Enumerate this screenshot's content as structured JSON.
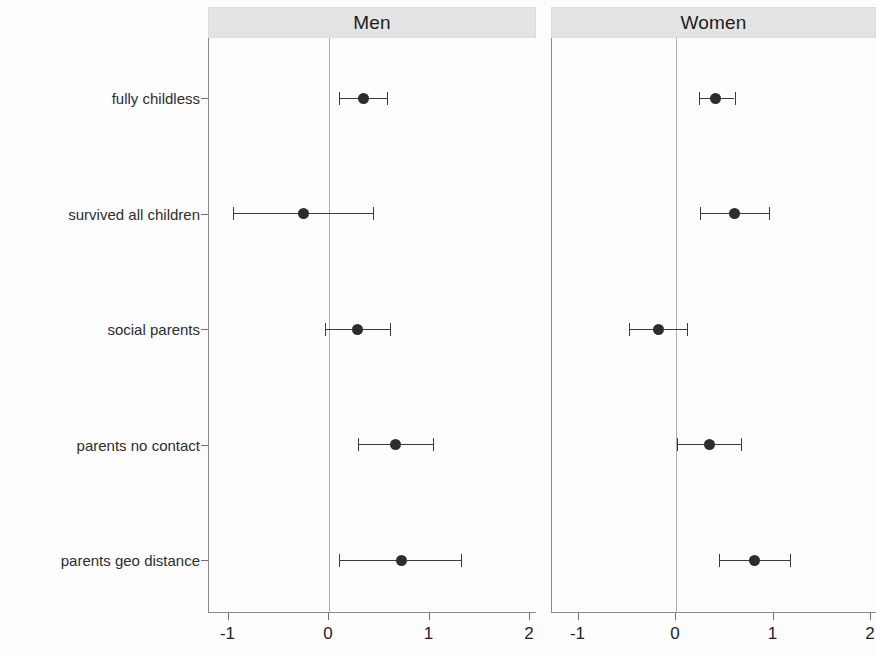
{
  "chart_data": {
    "type": "scatter",
    "title": "",
    "subtitle": "",
    "xlabel": "",
    "ylabel": "",
    "xlim": [
      -1.35,
      2.12
    ],
    "xticks": [
      -1,
      0,
      1,
      2
    ],
    "xticklabels": [
      "-1",
      "0",
      "1",
      "2"
    ],
    "grid": false,
    "legend": null,
    "zero_reference_line": 0,
    "categories": [
      "fully childless",
      "survived all children",
      "social parents",
      "parents no contact",
      "parents geo distance"
    ],
    "panels": [
      {
        "label": "Men",
        "series": [
          {
            "category": "fully childless",
            "estimate": 0.34,
            "ci_low": 0.1,
            "ci_high": 0.58
          },
          {
            "category": "survived all children",
            "estimate": -0.25,
            "ci_low": -0.96,
            "ci_high": 0.44
          },
          {
            "category": "social parents",
            "estimate": 0.28,
            "ci_low": -0.04,
            "ci_high": 0.61
          },
          {
            "category": "parents no contact",
            "estimate": 0.66,
            "ci_low": 0.29,
            "ci_high": 1.03
          },
          {
            "category": "parents geo distance",
            "estimate": 0.72,
            "ci_low": 0.1,
            "ci_high": 1.31
          }
        ]
      },
      {
        "label": "Women",
        "series": [
          {
            "category": "fully childless",
            "estimate": 0.41,
            "ci_low": 0.24,
            "ci_high": 0.6
          },
          {
            "category": "survived all children",
            "estimate": 0.6,
            "ci_low": 0.25,
            "ci_high": 0.95
          },
          {
            "category": "social parents",
            "estimate": -0.18,
            "ci_low": -0.48,
            "ci_high": 0.11
          },
          {
            "category": "parents no contact",
            "estimate": 0.34,
            "ci_low": 0.01,
            "ci_high": 0.67
          },
          {
            "category": "parents geo distance",
            "estimate": 0.8,
            "ci_low": 0.44,
            "ci_high": 1.17
          }
        ]
      }
    ]
  },
  "colors": {
    "point": "#2d2d2d",
    "interval": "#3b3b3b",
    "strip_background": "#e4e4e4",
    "axis": "#8a8a8a",
    "zero_line": "#aeaeae",
    "text": "#1f1f1f",
    "background": "#fdfdfd"
  }
}
